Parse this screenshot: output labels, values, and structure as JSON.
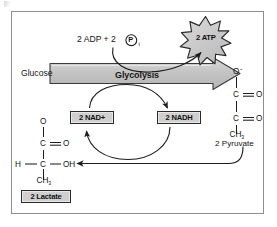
{
  "figure": {
    "frame_border_color": "#8e8e8e",
    "accent_fill": "#cfcfcf",
    "ink_color": "#141414"
  },
  "substrate": {
    "label": "Glucose"
  },
  "pathway_arrow": {
    "label": "Glycolysis"
  },
  "energy_input": {
    "adp_text": "2 ADP + 2",
    "phosphate_symbol": "P",
    "phosphate_subscript": "i",
    "phosphate_icon": "circled-p-icon"
  },
  "energy_output": {
    "label": "2 ATP",
    "icon": "starburst-icon",
    "points": 12
  },
  "cofactors": {
    "oxidized": "2 NAD+",
    "reduced": "2 NADH"
  },
  "pyruvate": {
    "name": "2 Pyruvate",
    "atoms": {
      "o_minus": "O",
      "o_minus_charge": "-",
      "c1": "C",
      "o1": "O",
      "c2": "C",
      "o2": "O",
      "ch3": "CH",
      "ch3_sub": "3"
    }
  },
  "lactate": {
    "name": "2 Lactate",
    "atoms": {
      "o_top": "O",
      "c1": "C",
      "o1": "O",
      "h": "H",
      "c2": "C",
      "oh": "OH",
      "ch3": "CH",
      "ch3_sub": "3"
    }
  },
  "bonds": {
    "double_bond": "=",
    "single_bond": "—"
  }
}
